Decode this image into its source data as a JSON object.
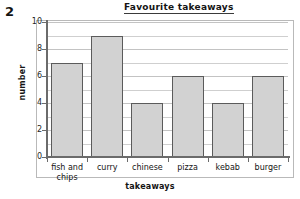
{
  "question_number": "2",
  "chart_data": {
    "type": "bar",
    "title": "Favourite takeaways",
    "xlabel": "takeaways",
    "ylabel": "number",
    "categories": [
      "fish and\nchips",
      "curry",
      "chinese",
      "pizza",
      "kebab",
      "burger"
    ],
    "values": [
      7,
      9,
      4,
      6,
      4,
      6
    ],
    "ylim": [
      0,
      10
    ],
    "ytick_labels": [
      "0",
      "2",
      "4",
      "6",
      "8",
      "10"
    ],
    "ytick_values": [
      0,
      2,
      4,
      6,
      8,
      10
    ],
    "gridline_interval": 1,
    "grid": true,
    "legend": "none",
    "bar_fill_color": "#d2d2d2",
    "bar_edge_color": "#5b5b5b",
    "gridline_color": "#cfcfcf",
    "axis_color": "#6b6b6b",
    "frame_color": "#b9b9b9",
    "background_color": "#ffffff"
  }
}
